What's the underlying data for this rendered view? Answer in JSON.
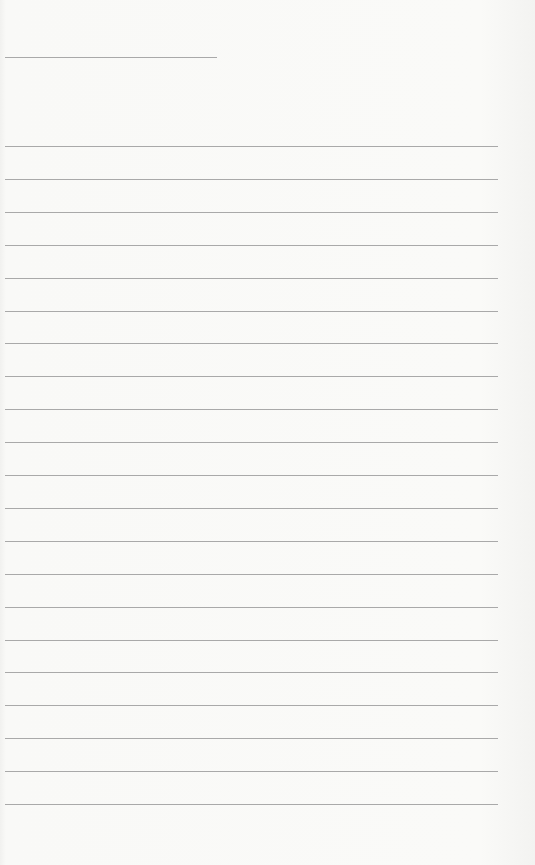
{
  "page": {
    "type": "lined-writing-paper",
    "title_line": {
      "label": ""
    },
    "lines": [
      {
        "value": ""
      },
      {
        "value": ""
      },
      {
        "value": ""
      },
      {
        "value": ""
      },
      {
        "value": ""
      },
      {
        "value": ""
      },
      {
        "value": ""
      },
      {
        "value": ""
      },
      {
        "value": ""
      },
      {
        "value": ""
      },
      {
        "value": ""
      },
      {
        "value": ""
      },
      {
        "value": ""
      },
      {
        "value": ""
      },
      {
        "value": ""
      },
      {
        "value": ""
      },
      {
        "value": ""
      },
      {
        "value": ""
      },
      {
        "value": ""
      },
      {
        "value": ""
      },
      {
        "value": ""
      }
    ],
    "colors": {
      "background": "#f8f8f6",
      "rule": "#a9a9a9"
    }
  }
}
